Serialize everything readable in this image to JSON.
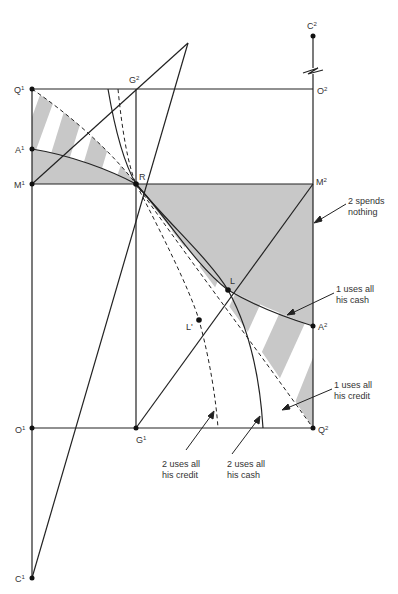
{
  "points": {
    "C2": {
      "name": "C",
      "sup": "2"
    },
    "Q1": {
      "name": "Q",
      "sup": "1"
    },
    "G2": {
      "name": "G",
      "sup": "2"
    },
    "O2": {
      "name": "O",
      "sup": "2"
    },
    "A1": {
      "name": "A",
      "sup": "1"
    },
    "M1": {
      "name": "M",
      "sup": "1"
    },
    "R": {
      "name": "R",
      "sup": ""
    },
    "M2": {
      "name": "M",
      "sup": "2"
    },
    "L": {
      "name": "L",
      "sup": ""
    },
    "Lp": {
      "name": "L'",
      "sup": ""
    },
    "A2": {
      "name": "A",
      "sup": "2"
    },
    "O1": {
      "name": "O",
      "sup": "1"
    },
    "G1": {
      "name": "G",
      "sup": "1"
    },
    "Q2": {
      "name": "Q",
      "sup": "2"
    },
    "C1": {
      "name": "C",
      "sup": "1"
    }
  },
  "annotations": {
    "spends_nothing": {
      "line1": "2 spends",
      "line2": "nothing"
    },
    "one_cash": {
      "line1": "1 uses all",
      "line2": "his cash"
    },
    "one_credit": {
      "line1": "1 uses all",
      "line2": "his credit"
    },
    "two_credit": {
      "line1": "2 uses all",
      "line2": "his credit"
    },
    "two_cash": {
      "line1": "2 uses all",
      "line2": "his cash"
    }
  },
  "colors": {
    "shade": "#c8c8c8",
    "line": "#222222"
  }
}
